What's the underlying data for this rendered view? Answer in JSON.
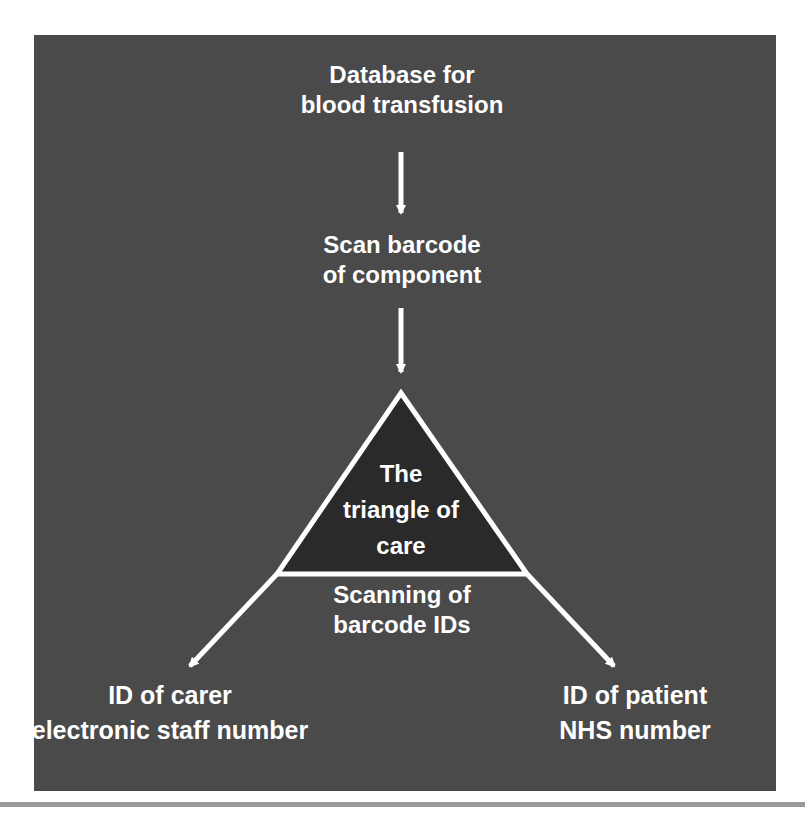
{
  "diagram": {
    "nodes": {
      "database": {
        "line1": "Database for",
        "line2": "blood transfusion"
      },
      "scan_component": {
        "line1": "Scan barcode",
        "line2": "of component"
      },
      "triangle": {
        "line1": "The",
        "line2": "triangle of",
        "line3": "care"
      },
      "scanning_ids": {
        "line1": "Scanning of",
        "line2": "barcode IDs"
      },
      "carer": {
        "line1": "ID of carer",
        "line2": "electronic staff number"
      },
      "patient": {
        "line1": "ID of patient",
        "line2": "NHS number"
      }
    },
    "edges": [
      {
        "from": "database",
        "to": "scan_component"
      },
      {
        "from": "scan_component",
        "to": "triangle"
      },
      {
        "from": "triangle",
        "to": "carer"
      },
      {
        "from": "triangle",
        "to": "patient"
      }
    ],
    "colors": {
      "panel_bg": "#4a4a4a",
      "triangle_fill": "#2a2a2a",
      "foreground": "#ffffff"
    }
  }
}
